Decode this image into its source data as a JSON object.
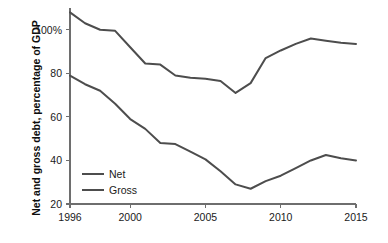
{
  "chart_data": {
    "type": "line",
    "title": "",
    "xlabel": "",
    "ylabel": "Net and gross debt, percentage of GDP",
    "xlim": [
      1996,
      2015
    ],
    "ylim": [
      20,
      110
    ],
    "grid": false,
    "legend_position": "inside-left",
    "x": [
      1996,
      1997,
      1998,
      1999,
      2000,
      2001,
      2002,
      2003,
      2004,
      2005,
      2006,
      2007,
      2008,
      2009,
      2010,
      2011,
      2012,
      2013,
      2014,
      2015
    ],
    "y_ticks": [
      20,
      40,
      60,
      80,
      100
    ],
    "y_tick_labels": [
      "20",
      "40",
      "60",
      "80",
      "100%"
    ],
    "x_ticks": [
      1996,
      2000,
      2005,
      2010,
      2015
    ],
    "x_tick_labels": [
      "1996",
      "2000",
      "2005",
      "2010",
      "2015"
    ],
    "series": [
      {
        "name": "Gross",
        "color": "#4d4d4d",
        "values": [
          108,
          103,
          100,
          99.5,
          92,
          84.5,
          84,
          79,
          78,
          77.5,
          76.5,
          71,
          75.5,
          87,
          90.5,
          93.5,
          96,
          95,
          94,
          93.5
        ]
      },
      {
        "name": "Net",
        "color": "#4d4d4d",
        "values": [
          79,
          75,
          72,
          66,
          59,
          54.5,
          48,
          47.5,
          44,
          40.5,
          35,
          29,
          27,
          30.5,
          33,
          36.5,
          40,
          42.5,
          41,
          40
        ]
      }
    ]
  },
  "legend": {
    "entries": [
      {
        "label": "Net"
      },
      {
        "label": "Gross"
      }
    ]
  },
  "axes": {
    "y_axis_title": "Net and gross debt, percentage of GDP"
  }
}
